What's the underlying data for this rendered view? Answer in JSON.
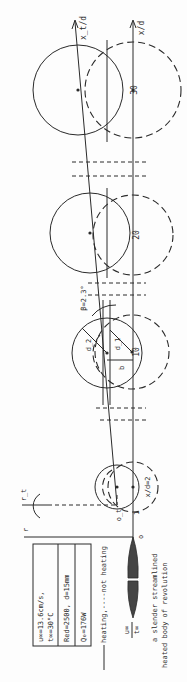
{
  "diagram": {
    "orientation": "rotated-90-ccw",
    "axes": {
      "x_label": "x/d",
      "xt_label": "x_t/d",
      "r_label": "r",
      "rt_label": "r_t",
      "origin_label": "o",
      "origin_t_label": "o_t",
      "tick_one": "1"
    },
    "stations": [
      {
        "label": "x/d=2"
      },
      {
        "label": "10",
        "beta_label": "β=2.3°",
        "b_label": "b",
        "d1_label": "d_1",
        "d2_label": "d_2"
      },
      {
        "label": "20"
      },
      {
        "label": "30"
      }
    ],
    "parameters": {
      "line1": "u∞=13.6cm/s,",
      "line2": "t∞=30°C",
      "line3": "Red=2500,  d=15mm",
      "line4": "Q₀=176W"
    },
    "legend": "heating,----not heating",
    "freestream": {
      "u": "u∞",
      "t": "t∞"
    },
    "caption": {
      "line1": "a slender streamlined",
      "line2": "heated body of revolution"
    },
    "colors": {
      "ink": "#2a2a2a",
      "background": "#fdfdfd"
    }
  }
}
